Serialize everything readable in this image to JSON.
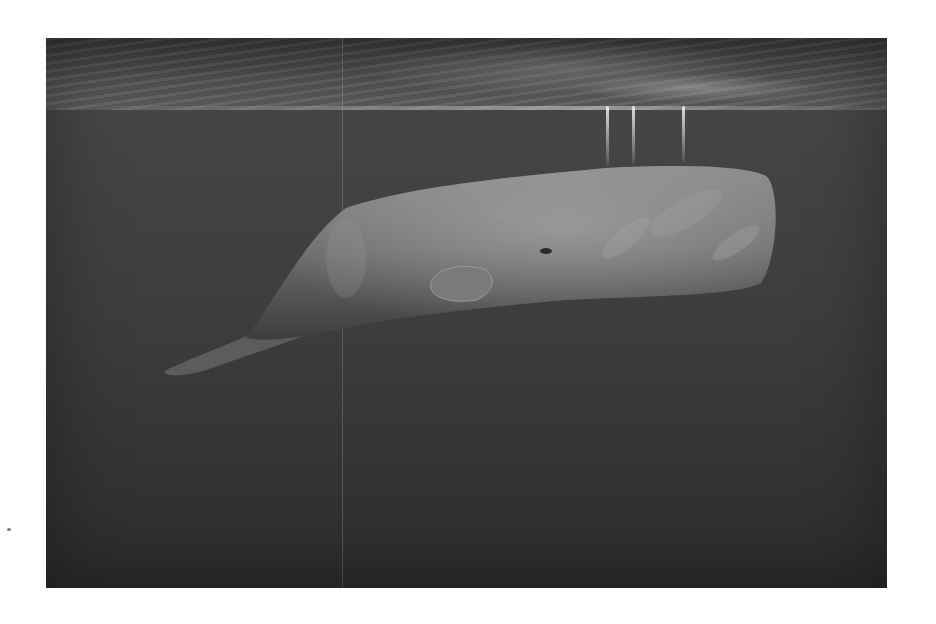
{
  "image": {
    "subject": "sperm whale swimming beneath the ocean surface",
    "style": "grayscale underwater photograph",
    "colors": {
      "page_background": "#ffffff",
      "water_top": "#4a4a4a",
      "water_bottom": "#2c2c2c",
      "whale_body": "#6e6e6e",
      "whale_highlight": "#a8a8a8",
      "surface_light": "#e6e6e6"
    },
    "frame": {
      "left": 46,
      "top": 38,
      "width": 841,
      "height": 550
    }
  }
}
